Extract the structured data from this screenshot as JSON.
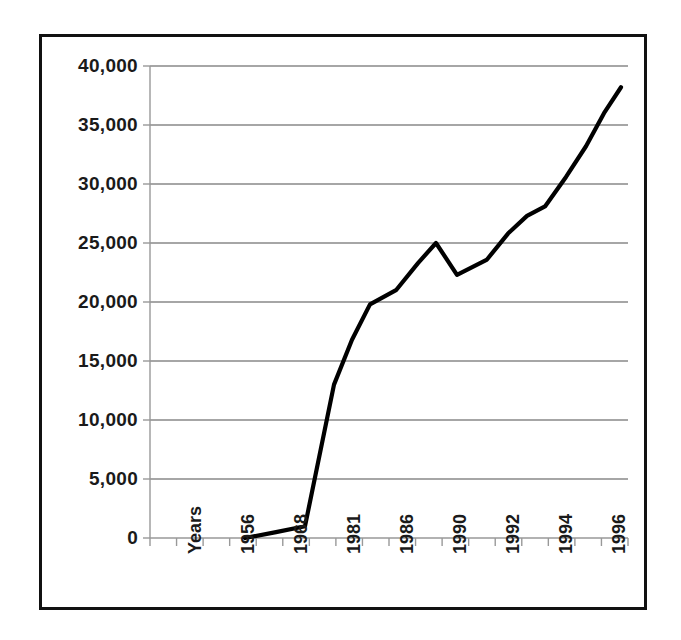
{
  "figure": {
    "background_color": "#ffffff",
    "frame_color": "#111111",
    "gridline_color": "#888888",
    "axis_color": "#999999",
    "series_color": "#000000"
  },
  "chart_data": {
    "type": "line",
    "title": "",
    "subtitle": "",
    "xlabel": "Years",
    "ylabel": "",
    "grid": "horizontal",
    "legend": "none",
    "ylim": [
      0,
      40000
    ],
    "ytick_labels": [
      "40,000",
      "35,000",
      "30,000",
      "25,000",
      "20,000",
      "15,000",
      "10,000",
      "5,000",
      "0"
    ],
    "ytick_values": [
      40000,
      35000,
      30000,
      25000,
      20000,
      15000,
      10000,
      5000,
      0
    ],
    "xtick_labels": [
      "Years",
      "1956",
      "1968",
      "1981",
      "1986",
      "1990",
      "1992",
      "1994",
      "1996"
    ],
    "x_axis_note": "Tick marks are evenly spaced; every other tick carries a label",
    "n_xticks": 18,
    "series": [
      {
        "name": "series-1",
        "x": [
          0,
          1,
          2,
          3,
          4,
          5,
          6,
          7,
          8,
          9,
          10,
          11,
          12,
          13,
          14,
          15,
          16,
          17
        ],
        "values": [
          0,
          0,
          0,
          0,
          0,
          200,
          450,
          1000,
          6500,
          13000,
          16800,
          19800,
          21000,
          23300,
          25000,
          22300,
          23600,
          25800
        ],
        "values_tail": [
          27300,
          28100,
          30600,
          33200,
          36000,
          38200
        ]
      }
    ],
    "points": [
      {
        "x_px": 245,
        "value": 0
      },
      {
        "x_px": 276,
        "value": 500
      },
      {
        "x_px": 305,
        "value": 1000
      },
      {
        "x_px": 334,
        "value": 13000
      },
      {
        "x_px": 352,
        "value": 16800
      },
      {
        "x_px": 370,
        "value": 19800
      },
      {
        "x_px": 396,
        "value": 21000
      },
      {
        "x_px": 418,
        "value": 23300
      },
      {
        "x_px": 436,
        "value": 25000
      },
      {
        "x_px": 457,
        "value": 22300
      },
      {
        "x_px": 487,
        "value": 23600
      },
      {
        "x_px": 508,
        "value": 25800
      },
      {
        "x_px": 527,
        "value": 27300
      },
      {
        "x_px": 545,
        "value": 28100
      },
      {
        "x_px": 566,
        "value": 30600
      },
      {
        "x_px": 586,
        "value": 33200
      },
      {
        "x_px": 604,
        "value": 36000
      },
      {
        "x_px": 621,
        "value": 38200
      }
    ]
  }
}
